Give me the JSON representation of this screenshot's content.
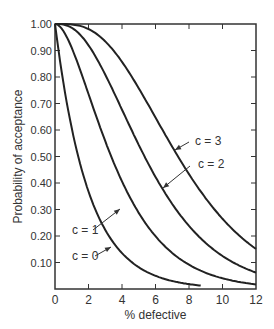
{
  "chart_data": {
    "type": "line",
    "title": "",
    "xlabel": "% defective",
    "ylabel": "Probability of acceptance",
    "xlim": [
      0,
      12
    ],
    "ylim": [
      0,
      1.0
    ],
    "x_ticks": [
      "0",
      "2",
      "4",
      "6",
      "8",
      "10",
      "12"
    ],
    "y_ticks": [
      "0.10",
      "0.20",
      "0.30",
      "0.40",
      "0.50",
      "0.60",
      "0.70",
      "0.80",
      "0.90",
      "1.00"
    ],
    "grid": false,
    "x": [
      0,
      1,
      2,
      3,
      4,
      5,
      6,
      7,
      8,
      9,
      10,
      11,
      12
    ],
    "series": [
      {
        "name": "c = 0",
        "values": [
          1.0,
          0.61,
          0.37,
          0.22,
          0.14,
          0.08,
          0.05,
          0.03,
          0.02,
          0.01,
          0.01,
          0.0,
          0.0
        ]
      },
      {
        "name": "c = 1",
        "values": [
          1.0,
          0.91,
          0.74,
          0.56,
          0.41,
          0.29,
          0.2,
          0.14,
          0.09,
          0.06,
          0.04,
          0.03,
          0.02
        ]
      },
      {
        "name": "c = 2",
        "values": [
          1.0,
          0.99,
          0.92,
          0.81,
          0.68,
          0.54,
          0.42,
          0.32,
          0.24,
          0.17,
          0.12,
          0.09,
          0.06
        ]
      },
      {
        "name": "c = 3",
        "values": [
          1.0,
          1.0,
          0.98,
          0.93,
          0.86,
          0.76,
          0.65,
          0.54,
          0.43,
          0.34,
          0.27,
          0.2,
          0.15
        ]
      }
    ],
    "annotations": [
      "c = 3",
      "c = 2",
      "c = 1",
      "c = 0"
    ]
  }
}
